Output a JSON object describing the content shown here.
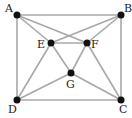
{
  "diagram": {
    "type": "graph",
    "nodes": [
      {
        "id": "A",
        "label": "A"
      },
      {
        "id": "B",
        "label": "B"
      },
      {
        "id": "C",
        "label": "C"
      },
      {
        "id": "D",
        "label": "D"
      },
      {
        "id": "E",
        "label": "E"
      },
      {
        "id": "F",
        "label": "F"
      },
      {
        "id": "G",
        "label": "G"
      }
    ],
    "edges": [
      [
        "A",
        "B"
      ],
      [
        "B",
        "C"
      ],
      [
        "C",
        "D"
      ],
      [
        "D",
        "A"
      ],
      [
        "A",
        "E"
      ],
      [
        "A",
        "F"
      ],
      [
        "B",
        "E"
      ],
      [
        "B",
        "F"
      ],
      [
        "E",
        "F"
      ],
      [
        "E",
        "G"
      ],
      [
        "F",
        "G"
      ],
      [
        "D",
        "E"
      ],
      [
        "F",
        "C"
      ],
      [
        "D",
        "G"
      ],
      [
        "G",
        "C"
      ]
    ],
    "colors": {
      "edge": "#a8a8a8",
      "node": "#111111",
      "label": "#222222"
    }
  }
}
